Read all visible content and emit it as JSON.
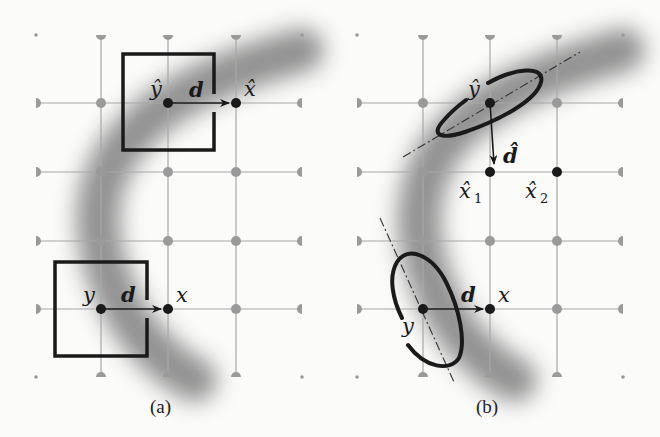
{
  "figure": {
    "panels": [
      {
        "id": "a",
        "caption": "(a)",
        "labels": {
          "y_hat": "ŷ",
          "d_top": "d",
          "x_hat": "x̂",
          "y": "y",
          "d_bottom": "d",
          "x": "x"
        },
        "window_shape": "square",
        "description": "Square patch windows along a curved gray structure; displacement d from y to x"
      },
      {
        "id": "b",
        "caption": "(b)",
        "labels": {
          "y_hat": "ŷ",
          "d_hat": "d̂",
          "x_hat_1": "x̂",
          "x_hat_1_sub": "1",
          "x_hat_2": "x̂",
          "x_hat_2_sub": "2",
          "y": "y",
          "d": "d",
          "x": "x"
        },
        "window_shape": "ellipse",
        "description": "Anisotropic elliptical windows aligned with structure orientation (dash-dot axes)"
      }
    ],
    "colors": {
      "grid": "#a8a8a8",
      "grid_node": "#9a9a9a",
      "structure": "#8c8c8c",
      "ink": "#1a1a1a"
    }
  }
}
